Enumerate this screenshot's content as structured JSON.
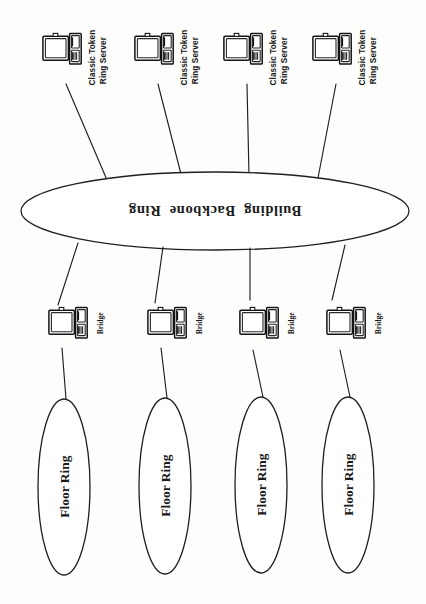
{
  "diagram": {
    "orientation_note": "scanned page rotated 180 degrees",
    "ink_color": "#1a1a1a",
    "paper_color": "#fdfdfc"
  },
  "backbone": {
    "label": "Building  Backbone  Ring",
    "shape": "ellipse"
  },
  "servers": [
    {
      "label_line1": "Classic Token",
      "label_line2": "Ring Server",
      "icon": "computer-icon"
    },
    {
      "label_line1": "Classic Token",
      "label_line2": "Ring Server",
      "icon": "computer-icon"
    },
    {
      "label_line1": "Classic Token",
      "label_line2": "Ring Server",
      "icon": "computer-icon"
    },
    {
      "label_line1": "Classic Token",
      "label_line2": "Ring Server",
      "icon": "computer-icon"
    }
  ],
  "bridges": [
    {
      "label": "Bridge",
      "icon": "computer-icon"
    },
    {
      "label": "Bridge",
      "icon": "computer-icon"
    },
    {
      "label": "Bridge",
      "icon": "computer-icon"
    },
    {
      "label": "Bridge",
      "icon": "computer-icon"
    }
  ],
  "floor_rings": [
    {
      "label": "Floor Ring",
      "shape": "ellipse"
    },
    {
      "label": "Floor Ring",
      "shape": "ellipse"
    },
    {
      "label": "Floor Ring",
      "shape": "ellipse"
    },
    {
      "label": "Floor Ring",
      "shape": "ellipse"
    }
  ]
}
